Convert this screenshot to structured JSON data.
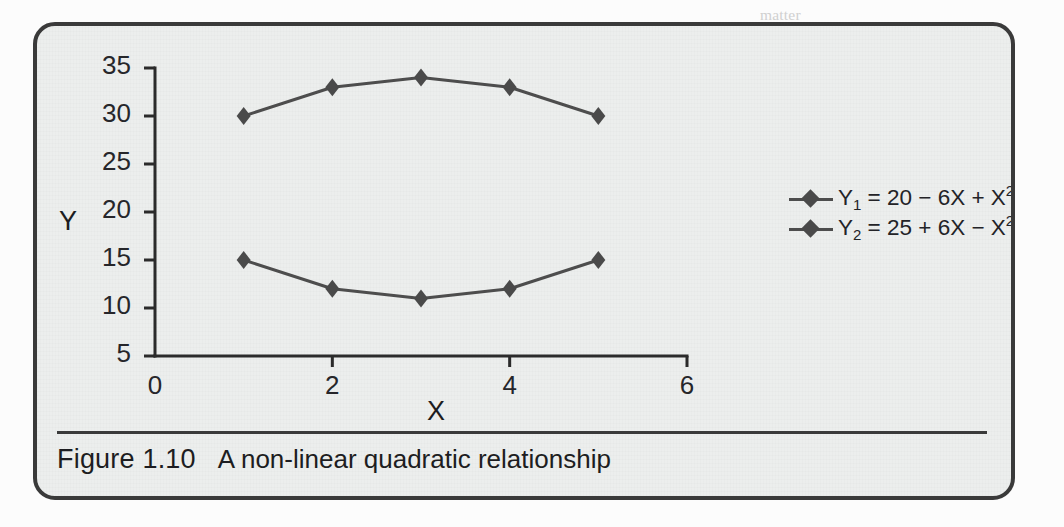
{
  "figure": {
    "number_label": "Figure 1.10",
    "caption": "A non-linear quadratic relationship"
  },
  "background_text": [
    {
      "text": "matter",
      "x": 760,
      "y": 6
    },
    {
      "text": "variation in any population, must instead concern us in terms of the things we",
      "x": 46,
      "y": 98
    },
    {
      "text": "study. A relationship, based the two lines  v, and a changed relation that we wish to detect all",
      "x": 46,
      "y": 124
    },
    {
      "text": "for the point where a rise in X suddenly changes direction. For Y, we would call it a maxi-",
      "x": 46,
      "y": 150
    },
    {
      "text": "mum; for Y2 we could call it a turning point a minimum.",
      "x": 46,
      "y": 176
    },
    {
      "text": "We need to see where a given variable has some effect (or mutually) on the simple relation of",
      "x": 46,
      "y": 232
    },
    {
      "text": "we recognize that in the strong or growing seasons, and the that proposal to one, or if we consider",
      "x": 46,
      "y": 258
    },
    {
      "text": "the air pressure, or the gradient, then we may be important both ways and secondly for the ac-",
      "x": 46,
      "y": 284
    },
    {
      "text": "count for the Y = X, or Y, plot.",
      "x": 46,
      "y": 310
    },
    {
      "text": "We note that there are in fact two functions here: a rise in X is always represented along the graph",
      "x": 46,
      "y": 360
    },
    {
      "text": "and so the peak of the function when X = 3. There we record Y = 34. This is the highest the value",
      "x": 46,
      "y": 386
    }
  ],
  "chart_data": {
    "type": "line",
    "title": "",
    "xlabel": "X",
    "ylabel": "Y",
    "x": [
      1,
      2,
      3,
      4,
      5
    ],
    "xlim": [
      0,
      6
    ],
    "ylim": [
      5,
      35
    ],
    "xticks": [
      0,
      2,
      4,
      6
    ],
    "xtick_labels": [
      "0",
      "2",
      "4",
      "6"
    ],
    "yticks": [
      5,
      10,
      15,
      20,
      25,
      30,
      35
    ],
    "ytick_labels": [
      "5",
      "10",
      "15",
      "20",
      "25",
      "30",
      "35"
    ],
    "grid": false,
    "legend_position": "right",
    "marker": "diamond",
    "line_color": "#4d4d4d",
    "marker_color": "#4a4a4a",
    "axis_color": "#2b2b2b",
    "series": [
      {
        "name": "Y1",
        "legend_label": "Y₁ = 20 − 6X + X²",
        "label_base": "Y",
        "label_sub": "1",
        "label_eq": " = 20 − 6X + X",
        "label_sup": "2",
        "values": [
          15,
          12,
          11,
          12,
          15
        ]
      },
      {
        "name": "Y2",
        "legend_label": "Y₂ = 25 + 6X − X²",
        "label_base": "Y",
        "label_sub": "2",
        "label_eq": " = 25 + 6X − X",
        "label_sup": "2",
        "values": [
          30,
          33,
          34,
          33,
          30
        ]
      }
    ]
  }
}
